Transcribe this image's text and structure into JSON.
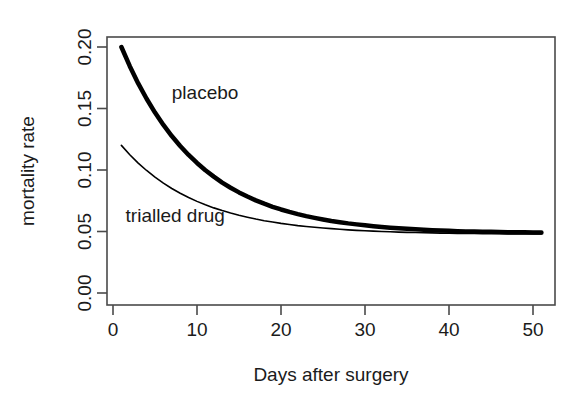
{
  "chart_data": {
    "type": "line",
    "title": "",
    "subtitle": "",
    "xlabel": "Days after surgery",
    "ylabel": "mortality rate",
    "xlim": [
      0,
      53
    ],
    "ylim": [
      0.0,
      0.205
    ],
    "xticks": [
      0,
      10,
      20,
      30,
      40,
      50
    ],
    "xticklabels": [
      "0",
      "10",
      "20",
      "30",
      "40",
      "50"
    ],
    "yticks": [
      0.0,
      0.05,
      0.1,
      0.15,
      0.2
    ],
    "yticklabels": [
      "0.00",
      "0.05",
      "0.10",
      "0.15",
      "0.20"
    ],
    "grid": false,
    "legend_position": "inline-annotations",
    "x": [
      1,
      2,
      3,
      4,
      5,
      6,
      7,
      8,
      9,
      10,
      11,
      12,
      13,
      14,
      15,
      16,
      17,
      18,
      19,
      20,
      21,
      22,
      23,
      24,
      25,
      26,
      27,
      28,
      29,
      30,
      31,
      32,
      33,
      34,
      35,
      36,
      37,
      38,
      39,
      40,
      41,
      42,
      43,
      44,
      45,
      46,
      47,
      48,
      49,
      50,
      51
    ],
    "series": [
      {
        "name": "placebo",
        "color": "#000000",
        "linewidth": 4.5,
        "asymptote": 0.05,
        "start_value": 0.2,
        "decay_rate": 0.11,
        "values": [
          0.2,
          0.1844,
          0.1704,
          0.1579,
          0.1467,
          0.1366,
          0.1276,
          0.1195,
          0.1122,
          0.1057,
          0.0998,
          0.0946,
          0.0898,
          0.0856,
          0.0818,
          0.0784,
          0.0753,
          0.0726,
          0.0701,
          0.0679,
          0.0659,
          0.0641,
          0.0625,
          0.0611,
          0.0598,
          0.0586,
          0.0576,
          0.0566,
          0.0558,
          0.055,
          0.0543,
          0.0537,
          0.0531,
          0.0526,
          0.0522,
          0.0518,
          0.0514,
          0.0511,
          0.0508,
          0.0506,
          0.0503,
          0.0501,
          0.05,
          0.0498,
          0.0497,
          0.0496,
          0.0494,
          0.0493,
          0.0493,
          0.0492,
          0.0491
        ]
      },
      {
        "name": "trialled drug",
        "color": "#000000",
        "linewidth": 1.6,
        "asymptote": 0.05,
        "start_value": 0.12,
        "decay_rate": 0.115,
        "values": [
          0.12,
          0.1124,
          0.1056,
          0.0996,
          0.0942,
          0.0893,
          0.085,
          0.0811,
          0.0776,
          0.0745,
          0.0717,
          0.0692,
          0.067,
          0.065,
          0.0632,
          0.0616,
          0.0601,
          0.0588,
          0.0577,
          0.0566,
          0.0557,
          0.0548,
          0.0541,
          0.0534,
          0.0528,
          0.0523,
          0.0518,
          0.0513,
          0.0509,
          0.0506,
          0.0503,
          0.05,
          0.0498,
          0.0495,
          0.0493,
          0.0492,
          0.049,
          0.0489,
          0.0487,
          0.0486,
          0.0485,
          0.0484,
          0.0484,
          0.0483,
          0.0482,
          0.0482,
          0.0481,
          0.0481,
          0.048,
          0.048,
          0.048
        ]
      }
    ],
    "annotations": [
      {
        "text": "placebo",
        "x": 7.0,
        "y": 0.158
      },
      {
        "text": "trialled drug",
        "x": 1.5,
        "y": 0.0575
      }
    ]
  },
  "axes": {
    "y_axis_title": "mortality rate",
    "x_axis_title": "Days after surgery"
  },
  "colors": {
    "background": "#ffffff",
    "ink": "#1b1b1b",
    "frame": "#4a4a4a",
    "curve": "#000000"
  }
}
